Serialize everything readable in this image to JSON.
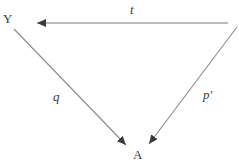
{
  "diagram": {
    "type": "commutative-triangle-diagram",
    "background_color": "#ffffff",
    "line_color": "#6e6e6e",
    "text_color": "#3d3d3d",
    "nodes": [
      {
        "id": "Y",
        "label": "Y",
        "x": 9,
        "y": 19
      },
      {
        "id": "A",
        "label": "A",
        "x": 138,
        "y": 155
      }
    ],
    "edges": [
      {
        "id": "t",
        "label": "t",
        "from": "top-right",
        "to": "Y",
        "direction": "leftward",
        "arrowhead": "at-Y-end",
        "label_x": 134,
        "label_y": 10
      },
      {
        "id": "q",
        "label": "q",
        "from": "Y",
        "to": "A",
        "direction": "down-right",
        "arrowhead": "at-A-end",
        "label_x": 57,
        "label_y": 97
      },
      {
        "id": "p-prime",
        "label": "p′",
        "from": "top-right",
        "to": "A",
        "direction": "down-left",
        "arrowhead": "at-A-end",
        "label_x": 209,
        "label_y": 95
      }
    ]
  }
}
